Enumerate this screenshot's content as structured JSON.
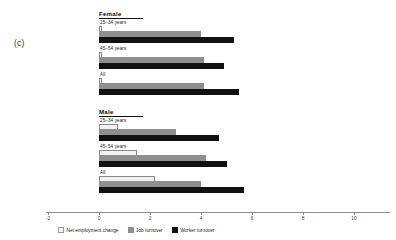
{
  "figure": {
    "panel_label": "(c)"
  },
  "legend": {
    "position": "bottom-left",
    "items": [
      {
        "label": "Net employment change",
        "color": "#f2f2f2"
      },
      {
        "label": "Job turnover",
        "color": "#8f8f8f"
      },
      {
        "label": "Worker turnover",
        "color": "#111111"
      }
    ]
  },
  "axis": {
    "ticks": [
      "-2",
      "0",
      "2",
      "4",
      "6",
      "8",
      "10",
      "12%"
    ],
    "tick_values": [
      -2,
      0,
      2,
      4,
      6,
      8,
      10,
      12
    ]
  },
  "panels": [
    {
      "heading": "Female",
      "groups": [
        "25–34 years",
        "45–54 years",
        "All"
      ]
    },
    {
      "heading": "Male",
      "groups": [
        "25–34 years",
        "45–54 years",
        "All"
      ]
    }
  ],
  "chart_data": {
    "type": "bar",
    "orientation": "horizontal",
    "title": "",
    "xlabel": "",
    "ylabel": "",
    "xlim": [
      -2,
      12
    ],
    "xticks": [
      -2,
      0,
      2,
      4,
      6,
      8,
      10,
      12
    ],
    "xtick_labels": [
      "-2",
      "0",
      "2",
      "4",
      "6",
      "8",
      "10",
      "12%"
    ],
    "grid": false,
    "legend_position": "bottom-left",
    "panels": [
      {
        "name": "Female",
        "categories": [
          "25–34 years",
          "45–54 years",
          "All"
        ],
        "series": [
          {
            "name": "Net employment change",
            "values": [
              0.1,
              0.1,
              0.1
            ]
          },
          {
            "name": "Job turnover",
            "values": [
              4.0,
              4.1,
              4.1
            ]
          },
          {
            "name": "Worker turnover",
            "values": [
              5.3,
              4.9,
              5.5
            ]
          }
        ]
      },
      {
        "name": "Male",
        "categories": [
          "25–34 years",
          "45–54 years",
          "All"
        ],
        "series": [
          {
            "name": "Net employment change",
            "values": [
              0.75,
              1.5,
              2.2
            ]
          },
          {
            "name": "Job turnover",
            "values": [
              3.0,
              4.2,
              4.0
            ]
          },
          {
            "name": "Worker turnover",
            "values": [
              4.7,
              5.0,
              5.7
            ]
          }
        ]
      }
    ]
  }
}
